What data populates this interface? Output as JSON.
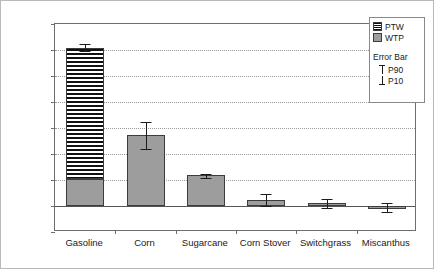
{
  "chart_data": {
    "type": "bar",
    "title": "",
    "subtitle": "",
    "xlabel": "",
    "ylabel": "Fossil Fuels Consumption (MJ/MJ)",
    "ylim": [
      -0.2,
      1.4
    ],
    "ytick_step": 0.2,
    "ytick_labels": [
      "1.4",
      "1.2",
      "1.0",
      "0.8",
      "0.6",
      "0.4",
      "0.2",
      "0.0",
      "-0.2"
    ],
    "ytick_values": [
      1.4,
      1.2,
      1.0,
      0.8,
      0.6,
      0.4,
      0.2,
      0.0,
      -0.2
    ],
    "grid": "horizontal-dotted",
    "stacked": true,
    "categories": [
      "Gasoline",
      "Corn",
      "Sugarcane",
      "Corn Stover",
      "Switchgrass",
      "Miscanthus"
    ],
    "series": [
      {
        "name": "WTP",
        "swatch": "gray",
        "color": "#9d9d9d",
        "values": [
          0.21,
          0.545,
          0.235,
          0.045,
          0.02,
          -0.02
        ]
      },
      {
        "name": "PTW",
        "swatch": "horizontal-hatch",
        "color": "#101010",
        "values": [
          1.005,
          0.0,
          0.0,
          0.0,
          0.0,
          0.0
        ]
      }
    ],
    "totals": [
      1.215,
      0.545,
      0.235,
      0.045,
      0.02,
      -0.02
    ],
    "error_bars": {
      "upper_label": "P90",
      "lower_label": "P10",
      "p90": [
        1.245,
        0.65,
        0.25,
        0.09,
        0.055,
        0.025
      ],
      "p10": [
        1.19,
        0.435,
        0.215,
        0.0,
        -0.015,
        -0.045
      ]
    },
    "legend": {
      "position": "top-right",
      "entries": [
        {
          "label": "PTW",
          "swatch": "horizontal-hatch"
        },
        {
          "label": "WTP",
          "swatch": "gray"
        }
      ],
      "error_bar_title": "Error Bar",
      "error_entries": [
        {
          "label": "P90",
          "cap": "top"
        },
        {
          "label": "P10",
          "cap": "bottom"
        }
      ]
    }
  }
}
